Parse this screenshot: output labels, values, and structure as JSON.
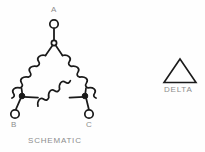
{
  "figure": {
    "background_color": "#fefefe",
    "line_color": "#1a1a1a",
    "label_color": "#8d8d8d",
    "width": 205,
    "height": 152
  },
  "schematic": {
    "caption": "SCHEMATIC",
    "terminals": [
      {
        "id": "A",
        "label": "A",
        "position": "top",
        "x": 54,
        "y": 24
      },
      {
        "id": "B",
        "label": "B",
        "position": "bottom-left",
        "x": 15,
        "y": 114
      },
      {
        "id": "C",
        "label": "C",
        "position": "bottom-right",
        "x": 89,
        "y": 114
      }
    ],
    "junctions": [
      {
        "id": "node-a",
        "x": 54,
        "y": 43
      },
      {
        "id": "node-b",
        "x": 22,
        "y": 96
      },
      {
        "id": "node-c",
        "x": 85,
        "y": 96
      }
    ],
    "coils": [
      {
        "id": "coil-ab",
        "from": "node-a",
        "to": "node-b",
        "turns": 5,
        "orientation": "diagonal-left"
      },
      {
        "id": "coil-ac",
        "from": "node-a",
        "to": "node-c",
        "turns": 5,
        "orientation": "diagonal-right"
      },
      {
        "id": "coil-bc",
        "from": "node-b",
        "to": "node-c",
        "turns": 5,
        "orientation": "horizontal"
      }
    ],
    "connection_type": "delta"
  },
  "symbol": {
    "caption": "DELTA",
    "shape": "triangle",
    "outline_only": true,
    "apex": {
      "x": 180,
      "y": 60
    },
    "base_left": {
      "x": 165,
      "y": 82
    },
    "base_right": {
      "x": 195,
      "y": 82
    }
  }
}
